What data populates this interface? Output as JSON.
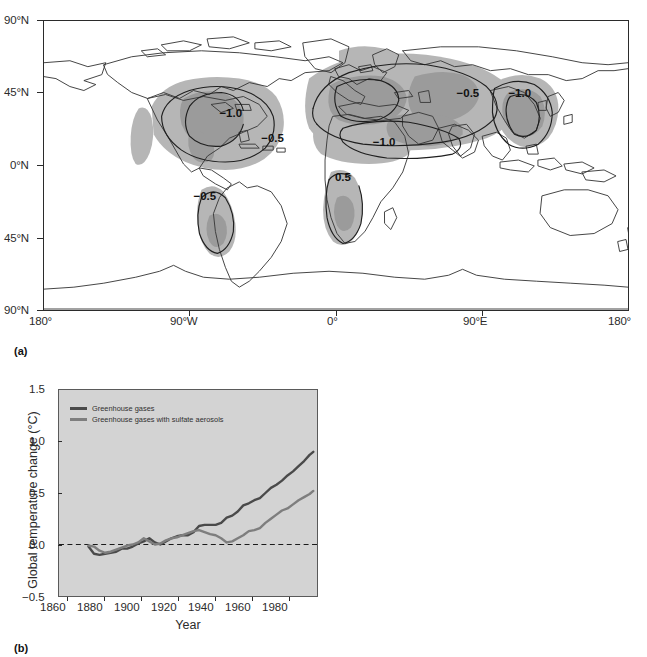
{
  "figure": {
    "panels": [
      {
        "tag": "(a)",
        "kind": "map"
      },
      {
        "tag": "(b)",
        "kind": "line-chart"
      }
    ]
  },
  "map": {
    "title": "",
    "y_ticks": [
      "90°N",
      "45°N",
      "0°N",
      "45°N",
      "90°N"
    ],
    "x_ticks": [
      "180°",
      "90°W",
      "0°",
      "90°E",
      "180°"
    ],
    "y_values": [
      90,
      45,
      0,
      -45,
      -90
    ],
    "x_values": [
      -180,
      -90,
      0,
      90,
      180
    ],
    "contour_labels": [
      {
        "text": "−1.0",
        "lon": -82,
        "lat": 36
      },
      {
        "text": "−0.5",
        "lon": -60,
        "lat": 26
      },
      {
        "text": "−0.5",
        "lon": -78,
        "lat": -8
      },
      {
        "text": "−1.0",
        "lon": 22,
        "lat": 27
      },
      {
        "text": "−0.5",
        "lon": 12,
        "lat": 3
      },
      {
        "text": "−0.5",
        "lon": 100,
        "lat": 47
      },
      {
        "text": "−1.0",
        "lon": 124,
        "lat": 47
      }
    ],
    "shading_colors": {
      "light": "#b6b6b6",
      "dark": "#9b9b9b",
      "coastline": "#3a3a3a",
      "contour": "#1f1f1f"
    }
  },
  "chart_data": {
    "type": "line",
    "title": "",
    "xlabel": "Year",
    "ylabel": "Global temperature change (°C)",
    "xlim": [
      1855,
      1995
    ],
    "ylim": [
      -0.5,
      1.5
    ],
    "xticks": [
      1860,
      1880,
      1900,
      1920,
      1940,
      1960,
      1980
    ],
    "xticklabels": [
      "1860",
      "1880",
      "1900",
      "1920",
      "1940",
      "1960",
      "1980"
    ],
    "yticks": [
      -0.5,
      0.0,
      0.5,
      1.0,
      1.5
    ],
    "yticklabels": [
      "−0.5",
      "0.0",
      "0.5",
      "1.0",
      "1.5"
    ],
    "grid": false,
    "plot_background": "#d3d3d3",
    "zero_line": {
      "value": 0.0,
      "style": "dashed",
      "color": "#1a1a1a"
    },
    "legend": {
      "position": "top-left"
    },
    "series": [
      {
        "name": "Greenhouse gases",
        "color": "#4a4a4a",
        "x": [
          1871,
          1874,
          1877,
          1880,
          1883,
          1886,
          1889,
          1892,
          1895,
          1898,
          1901,
          1904,
          1907,
          1910,
          1913,
          1916,
          1919,
          1922,
          1925,
          1928,
          1931,
          1934,
          1937,
          1940,
          1943,
          1946,
          1949,
          1952,
          1955,
          1958,
          1961,
          1964,
          1967,
          1970,
          1973,
          1976,
          1979,
          1982,
          1985,
          1988,
          1991,
          1993
        ],
        "values": [
          -0.02,
          -0.09,
          -0.1,
          -0.09,
          -0.08,
          -0.07,
          -0.04,
          -0.04,
          -0.02,
          0.01,
          0.03,
          0.06,
          0.02,
          0.0,
          0.03,
          0.06,
          0.08,
          0.09,
          0.09,
          0.12,
          0.18,
          0.19,
          0.19,
          0.19,
          0.21,
          0.26,
          0.28,
          0.32,
          0.38,
          0.4,
          0.43,
          0.45,
          0.5,
          0.55,
          0.58,
          0.62,
          0.67,
          0.71,
          0.76,
          0.81,
          0.87,
          0.9
        ]
      },
      {
        "name": "Greenhouse gases with sulfate aerosols",
        "color": "#7e7e7e",
        "x": [
          1871,
          1874,
          1877,
          1880,
          1883,
          1886,
          1889,
          1892,
          1895,
          1898,
          1901,
          1904,
          1907,
          1910,
          1913,
          1916,
          1919,
          1922,
          1925,
          1928,
          1931,
          1934,
          1937,
          1940,
          1943,
          1946,
          1949,
          1952,
          1955,
          1958,
          1961,
          1964,
          1967,
          1970,
          1973,
          1976,
          1979,
          1982,
          1985,
          1988,
          1991,
          1993
        ],
        "values": [
          -0.01,
          -0.02,
          -0.06,
          -0.08,
          -0.07,
          -0.05,
          -0.03,
          -0.01,
          0.0,
          0.02,
          0.06,
          0.03,
          0.0,
          0.01,
          0.04,
          0.06,
          0.07,
          0.09,
          0.11,
          0.13,
          0.14,
          0.12,
          0.1,
          0.09,
          0.06,
          0.02,
          0.03,
          0.06,
          0.09,
          0.13,
          0.14,
          0.16,
          0.21,
          0.25,
          0.29,
          0.33,
          0.35,
          0.39,
          0.43,
          0.46,
          0.49,
          0.52
        ]
      }
    ]
  }
}
